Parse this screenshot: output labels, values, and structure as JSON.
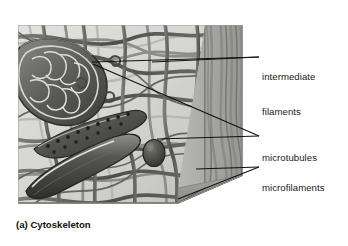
{
  "figure": {
    "caption": "(a) Cytoskeleton",
    "style": "grayscale-airbrush-textbook-art"
  },
  "labels": [
    {
      "id": "intermediate-filaments",
      "line1": "intermediate",
      "line2": "filaments",
      "x": 262,
      "y": 48,
      "leaders": [
        {
          "from_x": 92,
          "from_y": 62,
          "to_x": 259,
          "to_y": 57
        },
        {
          "from_x": 152,
          "from_y": 62,
          "to_x": 259,
          "to_y": 57
        }
      ]
    },
    {
      "id": "microtubules",
      "line1": "microtubules",
      "line2": "",
      "x": 262,
      "y": 129,
      "leaders": [
        {
          "from_x": 157,
          "from_y": 139,
          "to_x": 259,
          "to_y": 136
        },
        {
          "from_x": 93,
          "from_y": 64,
          "to_x": 259,
          "to_y": 136
        }
      ]
    },
    {
      "id": "microfilaments",
      "line1": "microfilaments",
      "line2": "",
      "x": 262,
      "y": 159,
      "leaders": [
        {
          "from_x": 196,
          "from_y": 169,
          "to_x": 259,
          "to_y": 167
        },
        {
          "from_x": 178,
          "from_y": 199,
          "to_x": 259,
          "to_y": 167
        }
      ]
    }
  ],
  "colors": {
    "page_background": "#ffffff",
    "label_text": "#1a1a1a",
    "caption_text": "#0f0f0f",
    "leader_line": "#111111",
    "cytosol_light": "#d9d9d6",
    "cytosol_mid": "#c3c3c0",
    "slab_face": "#b0b0ad",
    "slab_shadow": "#8f8f8c",
    "filament_dark": "#4a4a48",
    "filament_mid": "#6e6e6b",
    "organelle_dark": "#3a3a38",
    "organelle_light": "#9a9a97"
  },
  "illustration_parts": [
    {
      "name": "mitochondrion",
      "description": "elongated organelle with cristae, upper-left"
    },
    {
      "name": "rough-endoplasmic-reticulum",
      "description": "tube studded with ribosome dots, mid-left"
    },
    {
      "name": "smooth-tubule",
      "description": "elongated smooth organelle, lower-left"
    },
    {
      "name": "vesicle",
      "description": "small oval vesicle, center"
    },
    {
      "name": "membrane-slab",
      "description": "vertical 3D cut edge of plasma membrane, right side"
    },
    {
      "name": "filament-network",
      "description": "criss-crossing cytoskeletal fibers throughout"
    }
  ]
}
